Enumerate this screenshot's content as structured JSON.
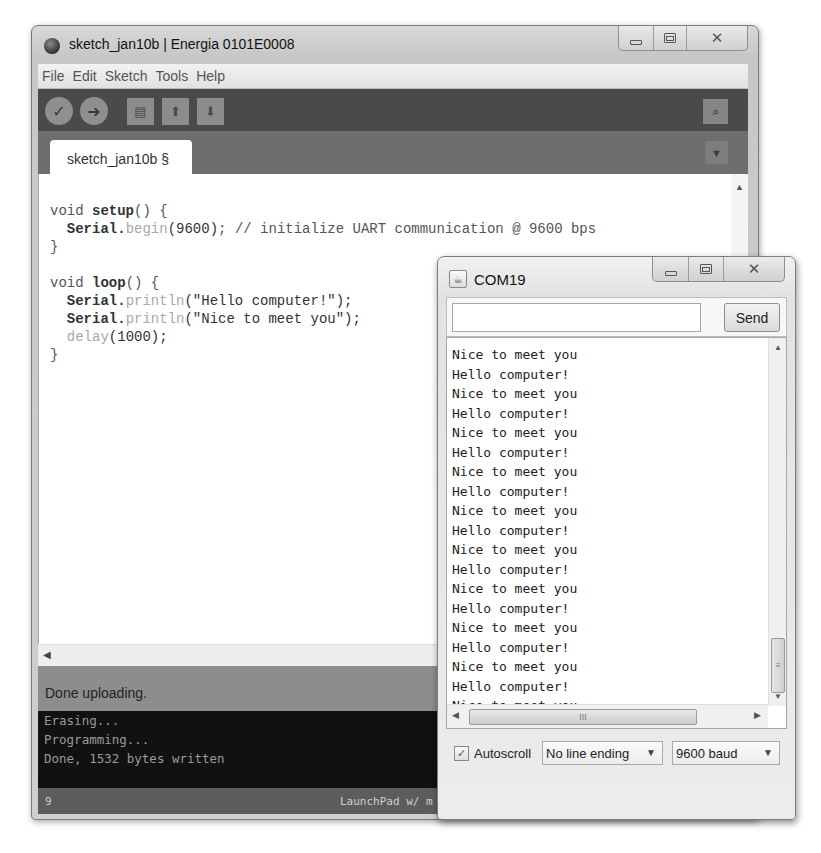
{
  "editor_window": {
    "title": "sketch_jan10b | Energia 0101E0008",
    "app_icon": "energia-logo-icon",
    "controls": {
      "minimize": "minimize-icon",
      "maximize": "maximize-icon",
      "close": "close-icon"
    },
    "menu": [
      "File",
      "Edit",
      "Sketch",
      "Tools",
      "Help"
    ],
    "toolbar": {
      "verify": {
        "icon": "check-icon",
        "glyph": "✓"
      },
      "upload": {
        "icon": "arrow-right-icon",
        "glyph": "➜"
      },
      "new": {
        "icon": "new-file-icon",
        "glyph": "▤"
      },
      "open": {
        "icon": "arrow-up-icon",
        "glyph": "⬆"
      },
      "save": {
        "icon": "arrow-down-icon",
        "glyph": "⬇"
      },
      "serial_monitor": {
        "icon": "magnifier-icon",
        "glyph": "⌕"
      }
    },
    "tabs": [
      {
        "label": "sketch_jan10b §"
      }
    ],
    "tab_menu_glyph": "▼",
    "code_lines": [
      [
        {
          "t": "void ",
          "c": ""
        },
        {
          "t": "setup",
          "c": "kw-bold"
        },
        {
          "t": "() {",
          "c": ""
        }
      ],
      [
        {
          "t": "  ",
          "c": ""
        },
        {
          "t": "Serial",
          "c": "kw-bold"
        },
        {
          "t": ".",
          "c": "kw-bold"
        },
        {
          "t": "begin",
          "c": "fn-light"
        },
        {
          "t": "(9600)",
          "c": "num"
        },
        {
          "t": "; // initialize UART communication @ 9600 bps",
          "c": ""
        }
      ],
      [
        {
          "t": "}",
          "c": ""
        }
      ],
      [
        {
          "t": "",
          "c": ""
        }
      ],
      [
        {
          "t": "void ",
          "c": ""
        },
        {
          "t": "loop",
          "c": "kw-bold"
        },
        {
          "t": "() {",
          "c": ""
        }
      ],
      [
        {
          "t": "  ",
          "c": ""
        },
        {
          "t": "Serial",
          "c": "kw-bold"
        },
        {
          "t": ".",
          "c": "kw-bold"
        },
        {
          "t": "println",
          "c": "fn-light"
        },
        {
          "t": "(\"Hello computer!\");",
          "c": "num"
        }
      ],
      [
        {
          "t": "  ",
          "c": ""
        },
        {
          "t": "Serial",
          "c": "kw-bold"
        },
        {
          "t": ".",
          "c": "kw-bold"
        },
        {
          "t": "println",
          "c": "fn-light"
        },
        {
          "t": "(\"Nice to meet you\");",
          "c": "num"
        }
      ],
      [
        {
          "t": "  ",
          "c": ""
        },
        {
          "t": "delay",
          "c": "fn-light"
        },
        {
          "t": "(1000);",
          "c": "num"
        }
      ],
      [
        {
          "t": "}",
          "c": ""
        }
      ]
    ],
    "status_message": "Done uploading.",
    "console_lines": [
      "Erasing...",
      "Programming...",
      "Done, 1532 bytes written"
    ],
    "footer": {
      "line_number": "9",
      "board": "LaunchPad w/ m"
    }
  },
  "serial_monitor": {
    "title": "COM19",
    "send_input": {
      "value": "",
      "placeholder": ""
    },
    "send_label": "Send",
    "output_lines": [
      "Nice to meet you",
      "Hello computer!",
      "Nice to meet you",
      "Hello computer!",
      "Nice to meet you",
      "Hello computer!",
      "Nice to meet you",
      "Hello computer!",
      "Nice to meet you",
      "Hello computer!",
      "Nice to meet you",
      "Hello computer!",
      "Nice to meet you",
      "Hello computer!",
      "Nice to meet you",
      "Hello computer!",
      "Nice to meet you",
      "Hello computer!",
      "Nice to meet you"
    ],
    "autoscroll": {
      "label": "Autoscroll",
      "checked": true,
      "glyph": "✓"
    },
    "line_ending": "No line ending",
    "baud_rate": "9600 baud",
    "scroll_thumb_glyph": "≡",
    "hscroll_thumb_glyph": "III"
  }
}
